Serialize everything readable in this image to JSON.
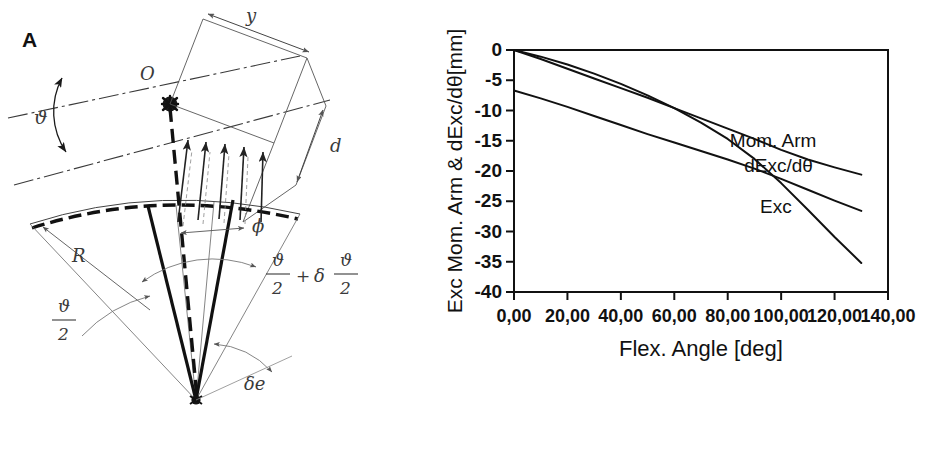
{
  "figure": {
    "panels": [
      {
        "id": "A",
        "letter": "A",
        "kind": "geometric-diagram"
      },
      {
        "id": "B",
        "letter": "B",
        "kind": "chart"
      }
    ]
  },
  "panel_a": {
    "letter": "A",
    "labels": {
      "origin": "O",
      "y_dimension": "y",
      "d_dimension": "d",
      "radius": "R",
      "phi": "ϕ",
      "theta": "ϑ",
      "half_theta_num": "ϑ",
      "half_theta_den": "2",
      "theta_half_plus_delta_num": "ϑ",
      "theta_half_plus_delta_den": "2",
      "plus": "+",
      "delta": "δ",
      "delta_e": "δe"
    }
  },
  "panel_b": {
    "letter": "B",
    "chart_data": {
      "type": "line",
      "title": "",
      "xlabel": "Flex. Angle [deg]",
      "ylabel": "Exc Mom. Arm & dExc/dθ[mm]",
      "xlim": [
        0,
        140
      ],
      "ylim": [
        -40,
        0
      ],
      "xticks": [
        0,
        20,
        40,
        60,
        80,
        100,
        120,
        140
      ],
      "xticklabels": [
        "0,00",
        "20,00",
        "40,00",
        "60,00",
        "80,00",
        "100,00",
        "120,00",
        "140,00"
      ],
      "yticks": [
        0,
        -5,
        -10,
        -15,
        -20,
        -25,
        -30,
        -35,
        -40
      ],
      "yticklabels": [
        "0",
        "-5",
        "-10",
        "-15",
        "-20",
        "-25",
        "-30",
        "-35",
        "-40"
      ],
      "grid": false,
      "legend_position": "inline-annotations",
      "series": [
        {
          "name": "Exc",
          "label": "Exc",
          "color": "#111111",
          "x": [
            0,
            10,
            20,
            30,
            40,
            50,
            60,
            70,
            80,
            90,
            100,
            110,
            120,
            130
          ],
          "values": [
            0,
            -1.1,
            -2.4,
            -3.9,
            -5.6,
            -7.5,
            -9.6,
            -12.0,
            -14.7,
            -18.0,
            -22.0,
            -26.4,
            -30.9,
            -35.2
          ]
        },
        {
          "name": "dExc/dtheta",
          "label": "dExc/dθ",
          "color": "#111111",
          "x": [
            0,
            10,
            20,
            30,
            40,
            50,
            60,
            70,
            80,
            90,
            100,
            110,
            120,
            130
          ],
          "values": [
            -6.7,
            -8.0,
            -9.4,
            -10.9,
            -12.4,
            -13.9,
            -15.3,
            -16.7,
            -18.1,
            -19.6,
            -21.3,
            -23.1,
            -24.9,
            -26.6
          ]
        },
        {
          "name": "Mom. Arm",
          "label": "Mom. Arm",
          "color": "#111111",
          "x": [
            0,
            10,
            20,
            30,
            40,
            50,
            60,
            70,
            80,
            90,
            100,
            110,
            120,
            130
          ],
          "values": [
            0,
            -1.5,
            -3.1,
            -4.7,
            -6.3,
            -7.9,
            -9.6,
            -11.3,
            -13.0,
            -14.7,
            -16.5,
            -18.1,
            -19.4,
            -20.6
          ]
        }
      ],
      "annotations": [
        {
          "text": "Mom. Arm",
          "x": 97,
          "y": -15.0
        },
        {
          "text": "dExc/dθ",
          "x": 99,
          "y": -19.2
        },
        {
          "text": "Exc",
          "x": 98,
          "y": -26.0
        }
      ]
    }
  }
}
